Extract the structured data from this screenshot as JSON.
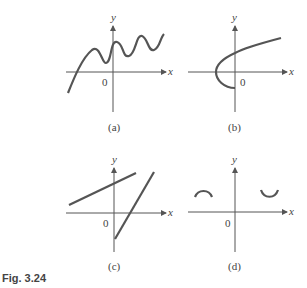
{
  "figure": {
    "label": "Fig. 3.24",
    "axis_x_label": "x",
    "axis_y_label": "y",
    "origin_label": "0",
    "panels": [
      {
        "id": "a",
        "caption": "(a)",
        "description": "wavy increasing curve"
      },
      {
        "id": "b",
        "caption": "(b)",
        "description": "sideways parabola opening right"
      },
      {
        "id": "c",
        "caption": "(c)",
        "description": "two intersecting line segments"
      },
      {
        "id": "d",
        "caption": "(d)",
        "description": "two small arcs: cap on left, cup on right"
      }
    ]
  },
  "colors": {
    "axis": "#555555",
    "curve": "#555555",
    "text": "#444444"
  }
}
